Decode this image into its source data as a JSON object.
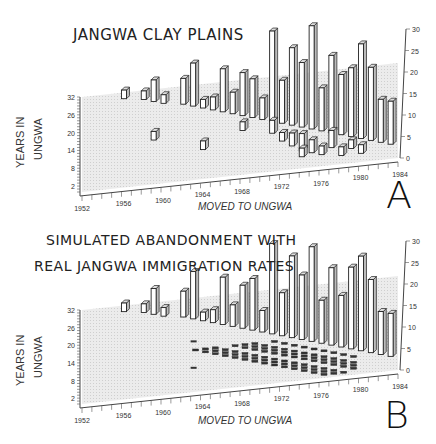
{
  "chart_data": [
    {
      "type": "bar3d",
      "panel_letter": "A",
      "title": "JANGWA CLAY PLAINS",
      "xlabel": "MOVED TO UNGWA",
      "ylabel_line1": "YEARS IN",
      "ylabel_line2": "UNGWA",
      "zlabel": "",
      "x_ticks": [
        "1952",
        "1956",
        "1960",
        "1964",
        "1968",
        "1972",
        "1976",
        "1980",
        "1984"
      ],
      "y_ticks": [
        "32",
        "26",
        "20",
        "14",
        "8",
        "2"
      ],
      "z_ticks": [
        "0",
        "5",
        "10",
        "15",
        "20",
        "25",
        "30"
      ],
      "xlim": [
        1952,
        1984
      ],
      "ylim": [
        0,
        32
      ],
      "zlim": [
        0,
        30
      ],
      "bars": [
        {
          "x": 1956,
          "y": 30,
          "z": 2
        },
        {
          "x": 1958,
          "y": 29,
          "z": 2
        },
        {
          "x": 1959,
          "y": 28,
          "z": 5
        },
        {
          "x": 1960,
          "y": 27,
          "z": 2
        },
        {
          "x": 1959,
          "y": 15,
          "z": 2
        },
        {
          "x": 1962,
          "y": 26,
          "z": 6
        },
        {
          "x": 1963,
          "y": 25,
          "z": 10
        },
        {
          "x": 1964,
          "y": 24,
          "z": 2
        },
        {
          "x": 1965,
          "y": 23,
          "z": 3
        },
        {
          "x": 1964,
          "y": 10,
          "z": 2
        },
        {
          "x": 1966,
          "y": 22,
          "z": 10
        },
        {
          "x": 1967,
          "y": 21,
          "z": 5
        },
        {
          "x": 1968,
          "y": 20,
          "z": 10
        },
        {
          "x": 1969,
          "y": 19,
          "z": 9
        },
        {
          "x": 1970,
          "y": 18,
          "z": 5
        },
        {
          "x": 1968,
          "y": 15,
          "z": 2
        },
        {
          "x": 1971,
          "y": 17,
          "z": 21
        },
        {
          "x": 1971,
          "y": 13,
          "z": 3
        },
        {
          "x": 1972,
          "y": 16,
          "z": 10
        },
        {
          "x": 1973,
          "y": 15,
          "z": 18
        },
        {
          "x": 1974,
          "y": 14,
          "z": 15
        },
        {
          "x": 1975,
          "y": 13,
          "z": 24
        },
        {
          "x": 1976,
          "y": 12,
          "z": 10
        },
        {
          "x": 1977,
          "y": 11,
          "z": 18
        },
        {
          "x": 1978,
          "y": 10,
          "z": 14
        },
        {
          "x": 1979,
          "y": 9,
          "z": 16
        },
        {
          "x": 1980,
          "y": 8,
          "z": 22
        },
        {
          "x": 1981,
          "y": 7,
          "z": 17
        },
        {
          "x": 1982,
          "y": 6,
          "z": 10
        },
        {
          "x": 1983,
          "y": 5,
          "z": 10
        },
        {
          "x": 1972,
          "y": 10,
          "z": 2
        },
        {
          "x": 1973,
          "y": 8,
          "z": 3
        },
        {
          "x": 1974,
          "y": 6,
          "z": 4
        },
        {
          "x": 1974,
          "y": 4,
          "z": 2
        },
        {
          "x": 1975,
          "y": 5,
          "z": 3
        },
        {
          "x": 1976,
          "y": 4,
          "z": 2
        },
        {
          "x": 1977,
          "y": 6,
          "z": 4
        },
        {
          "x": 1978,
          "y": 3,
          "z": 2
        },
        {
          "x": 1979,
          "y": 5,
          "z": 2
        },
        {
          "x": 1980,
          "y": 3,
          "z": 2
        }
      ]
    },
    {
      "type": "bar3d",
      "panel_letter": "B",
      "title_line1": "SIMULATED ABANDONMENT WITH",
      "title_line2": "REAL JANGWA IMMIGRATION RATES",
      "xlabel": "MOVED TO UNGWA",
      "ylabel_line1": "YEARS IN",
      "ylabel_line2": "UNGWA",
      "x_ticks": [
        "1952",
        "1956",
        "1960",
        "1964",
        "1968",
        "1972",
        "1976",
        "1980",
        "1984"
      ],
      "y_ticks": [
        "32",
        "26",
        "20",
        "14",
        "8",
        "2"
      ],
      "z_ticks": [
        "0",
        "5",
        "10",
        "15",
        "20",
        "25",
        "30"
      ],
      "xlim": [
        1952,
        1984
      ],
      "ylim": [
        0,
        32
      ],
      "zlim": [
        0,
        30
      ],
      "bars": [
        {
          "x": 1956,
          "y": 30,
          "z": 2
        },
        {
          "x": 1958,
          "y": 29,
          "z": 2
        },
        {
          "x": 1959,
          "y": 28,
          "z": 6
        },
        {
          "x": 1960,
          "y": 27,
          "z": 2
        },
        {
          "x": 1962,
          "y": 26,
          "z": 6
        },
        {
          "x": 1963,
          "y": 25,
          "z": 11
        },
        {
          "x": 1964,
          "y": 24,
          "z": 2
        },
        {
          "x": 1965,
          "y": 23,
          "z": 3
        },
        {
          "x": 1966,
          "y": 22,
          "z": 11
        },
        {
          "x": 1967,
          "y": 21,
          "z": 5
        },
        {
          "x": 1968,
          "y": 20,
          "z": 10
        },
        {
          "x": 1969,
          "y": 19,
          "z": 12
        },
        {
          "x": 1970,
          "y": 18,
          "z": 5
        },
        {
          "x": 1971,
          "y": 17,
          "z": 21
        },
        {
          "x": 1972,
          "y": 16,
          "z": 10
        },
        {
          "x": 1973,
          "y": 15,
          "z": 19
        },
        {
          "x": 1974,
          "y": 14,
          "z": 15
        },
        {
          "x": 1975,
          "y": 13,
          "z": 22
        },
        {
          "x": 1976,
          "y": 12,
          "z": 10
        },
        {
          "x": 1977,
          "y": 11,
          "z": 18
        },
        {
          "x": 1978,
          "y": 10,
          "z": 12
        },
        {
          "x": 1979,
          "y": 9,
          "z": 19
        },
        {
          "x": 1980,
          "y": 8,
          "z": 22
        },
        {
          "x": 1981,
          "y": 7,
          "z": 17
        },
        {
          "x": 1982,
          "y": 6,
          "z": 10
        },
        {
          "x": 1983,
          "y": 5,
          "z": 10
        }
      ],
      "small_marks_note": "Many small flat dark bars (value ~0-1) scattered for years 1963-1979 at low years-in-Ungwa"
    }
  ]
}
